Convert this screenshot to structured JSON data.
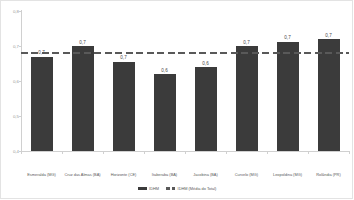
{
  "chart_data": {
    "type": "bar",
    "title": "",
    "xlabel": "",
    "ylabel": "",
    "ylim": [
      0.4,
      0.8
    ],
    "ytick_labels": [
      "0,8",
      "0,7",
      "0,6",
      "0,5",
      "0,4"
    ],
    "ytick_values": [
      0.8,
      0.7,
      0.6,
      0.5,
      0.4
    ],
    "grid": false,
    "legend_position": "bottom-center",
    "categories": [
      "Esmeralda (MG)",
      "Cruz das Almas (BA)",
      "Horizonte (CE)",
      "Itaberaba (BA)",
      "Jacobina (BA)",
      "Curvelo (MG)",
      "Leopoldina (MG)",
      "Rolândia (PR)"
    ],
    "series": [
      {
        "name": "IDHM",
        "type": "bar",
        "color": "#3b3b3b",
        "values": [
          0.67,
          0.7,
          0.655,
          0.62,
          0.64,
          0.7,
          0.712,
          0.72
        ],
        "data_labels": [
          "0,7",
          "0,7",
          "0,7",
          "0,6",
          "0,6",
          "0,7",
          "0,7",
          "0,7"
        ]
      },
      {
        "name": "IDHM (Média do Total)",
        "type": "line",
        "style": "dashed",
        "color": "#595959",
        "value": 0.68
      }
    ],
    "legend": [
      {
        "label": "IDHM",
        "marker": "solid-bar",
        "color": "#3b3b3b"
      },
      {
        "label": "IDHM (Média do Total)",
        "marker": "dashed-line",
        "color": "#595959"
      }
    ]
  }
}
